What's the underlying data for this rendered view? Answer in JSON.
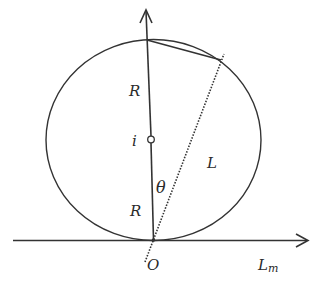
{
  "diagram": {
    "colors": {
      "stroke": "#333333",
      "background": "#ffffff"
    },
    "labels": {
      "upper_radius": "R",
      "lower_radius": "R",
      "center": "i",
      "angle": "θ",
      "line_length": "L",
      "origin": "O",
      "horizontal_axis": "L",
      "horizontal_axis_sub": "m"
    },
    "elements": [
      {
        "type": "circle",
        "name": "circle",
        "center": [
          153,
          140
        ],
        "rx": 107,
        "ry": 100
      },
      {
        "type": "arrow",
        "name": "vertical-axis",
        "from": [
          153,
          240
        ],
        "to": [
          147,
          10
        ]
      },
      {
        "type": "arrow",
        "name": "horizontal-axis",
        "from": [
          13,
          240
        ],
        "to": [
          308,
          240
        ]
      },
      {
        "type": "line",
        "name": "chord",
        "from": [
          147,
          40
        ],
        "to": [
          221,
          60
        ]
      },
      {
        "type": "dotted-line",
        "name": "line-L",
        "from": [
          145,
          262
        ],
        "to": [
          224,
          53
        ]
      },
      {
        "type": "point",
        "name": "center-point-i",
        "at": [
          151,
          139
        ]
      }
    ]
  }
}
